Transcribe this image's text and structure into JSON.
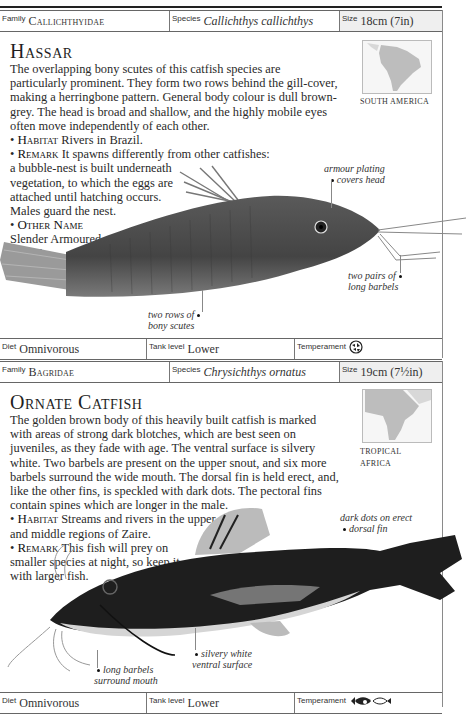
{
  "cards": [
    {
      "header": {
        "family_label": "Family",
        "family_value": "Callichthyidae",
        "species_label": "Species",
        "species_value": "Callichthys callichthys",
        "size_label": "Size",
        "size_value": "18cm (7in)"
      },
      "title": "Hassar",
      "description": "The overlapping bony scutes of this catfish species are particularly prominent. They form two rows behind the gill-cover, making a herringbone pattern. General body colour is dull brown-grey. The head is broad and shallow, and the highly mobile eyes often move independently of each other.",
      "habitat_label": "Habitat",
      "habitat_text": "Rivers in Brazil.",
      "remark_label": "Remark",
      "remark_text_line1": "It spawns differently from other catfishes:",
      "remark_text_rest": [
        "a bubble-nest is built underneath",
        "vegetation, to which the eggs are",
        "attached until hatching occurs.",
        "Males guard the nest."
      ],
      "other_name_label": "Other Name",
      "other_name_lines": [
        "Slender Armoured",
        "Catfish."
      ],
      "map_label": "SOUTH AMERICA",
      "callouts": {
        "armour": [
          "armour plating",
          "covers head"
        ],
        "barbels": [
          "two pairs of",
          "long barbels"
        ],
        "scutes": [
          "two rows of",
          "bony scutes"
        ]
      },
      "footer": {
        "diet_label": "Diet",
        "diet_value": "Omnivorous",
        "tank_label": "Tank level",
        "tank_value": "Lower",
        "temperament_label": "Temperament",
        "temperament_icon": "peaceful-community-fish-icon"
      }
    },
    {
      "header": {
        "family_label": "Family",
        "family_value": "Bagridae",
        "species_label": "Species",
        "species_value": "Chrysichthys ornatus",
        "size_label": "Size",
        "size_value": "19cm (7½in)"
      },
      "title": "Ornate Catfish",
      "description": "The golden brown body of this heavily built catfish is marked with areas of strong dark blotches, which are best seen on juveniles, as they fade with age. The ventral surface is silvery white. Two barbels are present on the upper snout, and six more barbels surround the wide mouth. The dorsal fin is held erect, and, like the other fins, is speckled with dark dots. The pectoral fins contain spines which are longer in the male.",
      "habitat_label": "Habitat",
      "habitat_lines": [
        "Streams and rivers in the upper",
        "and middle regions of Zaire."
      ],
      "remark_label": "Remark",
      "remark_lines": [
        "This fish will prey on",
        "smaller species at night, so keep it",
        "with larger fish."
      ],
      "map_label_lines": [
        "TROPICAL",
        "AFRICA"
      ],
      "callouts": {
        "dorsal": [
          "dark dots on erect",
          "dorsal fin"
        ],
        "ventral": [
          "silvery white",
          "ventral surface"
        ],
        "barbels": [
          "long barbels",
          "surround mouth"
        ]
      },
      "footer": {
        "diet_label": "Diet",
        "diet_value": "Omnivorous",
        "tank_label": "Tank level",
        "tank_value": "Lower",
        "temperament_label": "Temperament",
        "temperament_icon": "predatory-fish-icon"
      }
    }
  ]
}
